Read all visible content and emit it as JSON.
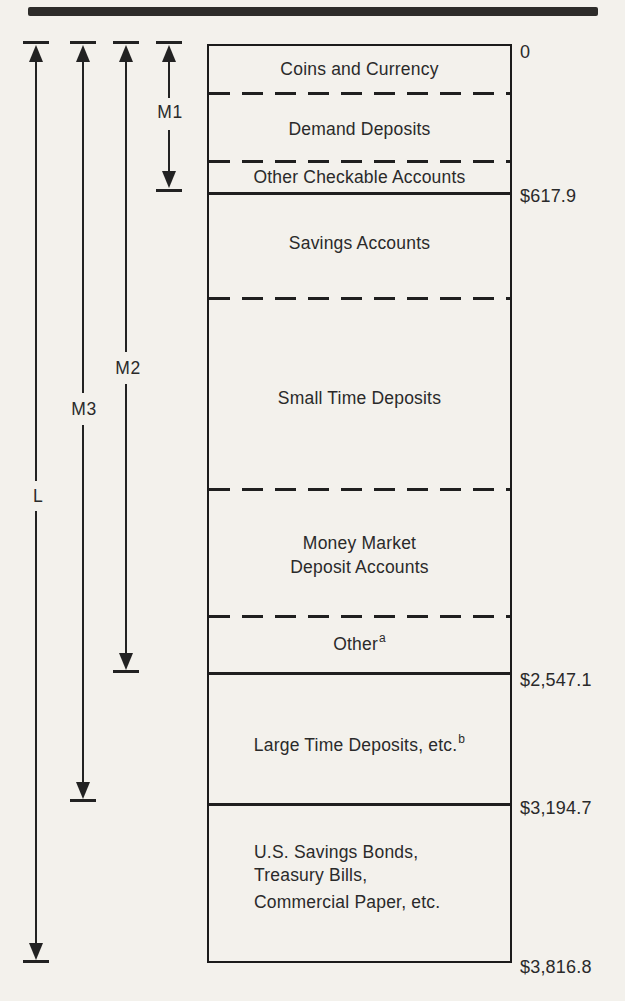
{
  "figure": {
    "origin_value": "0",
    "segments": [
      {
        "label": "Coins and Currency"
      },
      {
        "label": "Demand Deposits"
      },
      {
        "label": "Other Checkable Accounts"
      },
      {
        "label": "Savings Accounts"
      },
      {
        "label": "Small Time Deposits"
      },
      {
        "label": "Money Market Deposit Accounts",
        "lines": [
          "Money Market",
          "Deposit Accounts"
        ]
      },
      {
        "label": "Other",
        "footnote": "a"
      },
      {
        "label": "Large Time Deposits, etc.",
        "footnote": "b"
      },
      {
        "label": "U.S. Savings Bonds, Treasury Bills, Commercial Paper, etc.",
        "lines": [
          "U.S. Savings Bonds,",
          "Treasury Bills,",
          "Commercial Paper, etc."
        ]
      }
    ],
    "markers": [
      {
        "value": "0"
      },
      {
        "value": "$617.9"
      },
      {
        "value": "$2,547.1"
      },
      {
        "value": "$3,194.7"
      },
      {
        "value": "$3,816.8"
      }
    ],
    "brackets": [
      {
        "label": "L",
        "from_value": "0",
        "to_value": "$3,816.8"
      },
      {
        "label": "M3",
        "from_value": "0",
        "to_value": "$3,194.7"
      },
      {
        "label": "M2",
        "from_value": "0",
        "to_value": "$2,547.1"
      },
      {
        "label": "M1",
        "from_value": "0",
        "to_value": "$617.9"
      }
    ]
  }
}
